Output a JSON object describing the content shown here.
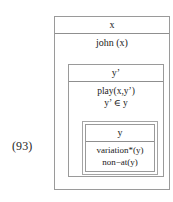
{
  "equation": {
    "number": "(93)"
  },
  "operators": {
    "negation": "¬"
  },
  "drs": {
    "outer": {
      "universe": "x",
      "conditions": [
        "john (x)"
      ]
    },
    "middle": {
      "universe": "y’",
      "conditions": [
        "play(x,y’)",
        "y’ ∈ y"
      ]
    },
    "inner": {
      "universe": "y",
      "conditions": [
        "variation*(y)",
        "non−at(y)"
      ]
    }
  },
  "colors": {
    "border": "#9a9a9a",
    "text": "#1a1a1a",
    "background": "#ffffff"
  }
}
